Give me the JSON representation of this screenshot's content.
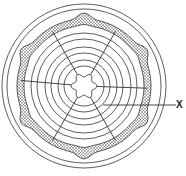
{
  "diagram": {
    "center": [
      84,
      86
    ],
    "outer_circle_radii": [
      82,
      77
    ],
    "ring_radii": [
      20,
      26,
      33,
      39,
      47,
      53
    ],
    "core": {
      "lobes": 6,
      "radius": 11
    },
    "band": {
      "inner_radius": 60,
      "outer_radius": 67,
      "bumps": 6,
      "fill": "#9a9a9a"
    },
    "spoke_angles_deg": [
      -120,
      -60,
      185,
      2,
      120,
      60
    ],
    "line_color": "#333333",
    "label": {
      "text": "X",
      "pointer_from": [
        103,
        105
      ],
      "pointer_to": [
        176,
        105
      ]
    }
  }
}
